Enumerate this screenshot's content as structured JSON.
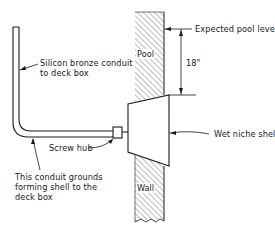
{
  "diagram": {
    "type": "cross-section",
    "labels": {
      "conduit": "Silicon bronze conduit\nto deck box",
      "screw_hub": "Screw hub",
      "grounding_note": "This conduit grounds\nforming shell to the\ndeck box",
      "pool_level": "Expected pool level",
      "dimension": "18\"",
      "niche": "Wet niche shell",
      "pool": "Pool",
      "wall": "Wall"
    },
    "colors": {
      "line": "#1a1a1a",
      "hatch": "#6a6a6a",
      "background": "#ffffff"
    }
  }
}
